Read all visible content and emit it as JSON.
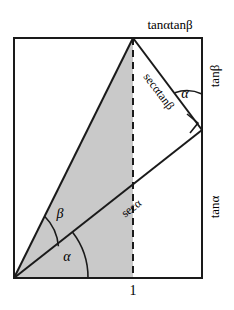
{
  "figure": {
    "title_label": "tanαtanβ",
    "base_label": "1",
    "right_upper_label": "tanβ",
    "right_lower_label": "tanα",
    "hypotenuse_upper_label": "secαtanβ",
    "hypotenuse_lower_label": "secα",
    "angle_beta_label": "β",
    "angle_alpha_lower_label": "α",
    "angle_alpha_upper_label": "α",
    "right_angle_marker": "right-angle",
    "colors": {
      "stroke": "#1a1a1a",
      "fill_shaded": "#c9c9c9",
      "background": "#ffffff",
      "text": "#000000"
    },
    "geometry": {
      "rect_left": 14,
      "rect_top": 38,
      "rect_right": 202,
      "rect_bottom": 278,
      "apex_x": 133,
      "apex_y": 38,
      "origin_x": 14,
      "origin_y": 278,
      "foot_x": 133,
      "foot_y": 278,
      "right_edge_point_x": 202,
      "right_edge_point_y": 130
    }
  }
}
